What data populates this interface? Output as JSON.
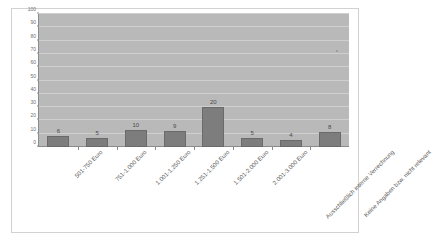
{
  "figure": {
    "title_sliver": "",
    "background_color": "#ffffff",
    "border_color": "#d2d2d2"
  },
  "colors": {
    "plot_background": "#b9b9b9",
    "gridline": "#cfcfcf",
    "axis": "#8c8c8c",
    "bar_fill": "#7d7d7d",
    "bar_border": "#6a6a6a",
    "label_text": "#5c5c5c"
  },
  "chart_data": {
    "type": "bar",
    "title": "",
    "xlabel": "",
    "ylabel": "",
    "ylim": [
      0,
      100
    ],
    "yticks": [
      0,
      10,
      20,
      30,
      40,
      50,
      60,
      70,
      80,
      90,
      100
    ],
    "grid": true,
    "legend": "none",
    "categories": [
      "501-750 Euro",
      "751-1.000 Euro",
      "1.001-1.250 Euro",
      "1.251-1.500 Euro",
      "1.501-2.000 Euro",
      "2.001-3.000 Euro",
      "Ausschließlich interne Verrechnung",
      "Keine Angaben bzw. nicht relevant"
    ],
    "values": [
      6,
      5,
      10,
      9,
      20,
      5,
      4,
      8
    ],
    "data_labels": [
      "6",
      "5",
      "10",
      "9",
      "20",
      "5",
      "4",
      "8"
    ],
    "bar_heights_on_axis": [
      8,
      7,
      13,
      12,
      30,
      6.5,
      5.5,
      11.5
    ]
  }
}
